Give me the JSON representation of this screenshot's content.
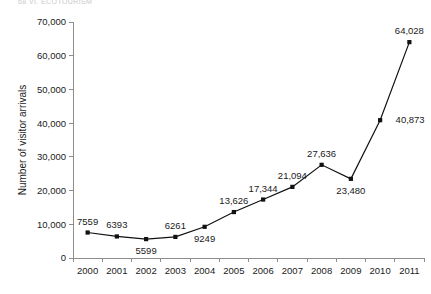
{
  "page_header": "68   VI. ECOTOURISM",
  "chart_data": {
    "type": "line",
    "title": "",
    "xlabel": "",
    "ylabel": "Number of visitor arrivals",
    "categories": [
      "2000",
      "2001",
      "2002",
      "2003",
      "2004",
      "2005",
      "2006",
      "2007",
      "2008",
      "2009",
      "2010",
      "2011"
    ],
    "values": [
      7559,
      6393,
      5599,
      6261,
      9249,
      13626,
      17344,
      21094,
      27636,
      23480,
      40873,
      64028
    ],
    "point_labels": [
      "7559",
      "6393",
      "5599",
      "6261",
      "9249",
      "13,626",
      "17,344",
      "21,094",
      "27,636",
      "23,480",
      "40,873",
      "64,028"
    ],
    "label_positions": [
      "above",
      "above",
      "below",
      "above",
      "below",
      "above",
      "above",
      "above",
      "above",
      "below",
      "right",
      "above"
    ],
    "ylim": [
      0,
      70000
    ],
    "ytick_values": [
      0,
      10000,
      20000,
      30000,
      40000,
      50000,
      60000,
      70000
    ],
    "ytick_labels": [
      "0",
      "10,000",
      "20,000",
      "30,000",
      "40,000",
      "50,000",
      "60,000",
      "70,000"
    ],
    "grid": false,
    "legend": "none",
    "line_color": "#111111",
    "marker": "square",
    "marker_color": "#111111",
    "axis_color": "#8d8d8d"
  }
}
